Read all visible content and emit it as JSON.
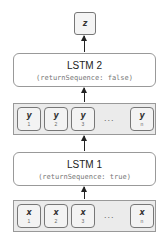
{
  "output": {
    "label": "z"
  },
  "lstm2": {
    "title": "LSTM 2",
    "subtitle": "(returnSequence: false)"
  },
  "y_sequence": {
    "cells": [
      {
        "var": "y",
        "index": "1"
      },
      {
        "var": "y",
        "index": "2"
      },
      {
        "var": "y",
        "index": "3"
      },
      {
        "var": "y",
        "index": "n"
      }
    ],
    "ellipsis": "..."
  },
  "lstm1": {
    "title": "LSTM 1",
    "subtitle": "(returnSequence: true)"
  },
  "x_sequence": {
    "cells": [
      {
        "var": "x",
        "index": "1"
      },
      {
        "var": "x",
        "index": "2"
      },
      {
        "var": "x",
        "index": "3"
      },
      {
        "var": "x",
        "index": "n"
      }
    ],
    "ellipsis": "..."
  },
  "colors": {
    "border": "#999999",
    "row_fill": "#ebebeb",
    "arrow": "#222222"
  }
}
